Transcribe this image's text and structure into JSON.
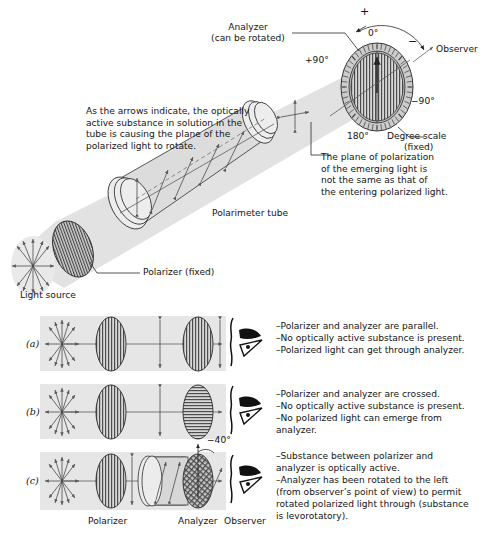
{
  "figure": {
    "top_annotation": "As the arrows indicate, the optically\nactive substance in solution in the\ntube is causing the plane of the\npolarized light to rotate.",
    "right_annotation": "The plane of polarization\nof the emerging light is\nnot the same as that of\nthe entering polarized light."
  },
  "top_labels": {
    "analyzer": "Analyzer",
    "analyzer_sub": "(can be rotated)",
    "observer": "Observer",
    "degree_scale": "Degree scale",
    "degree_scale_sub": "(fixed)",
    "polarimeter_tube": "Polarimeter tube",
    "polarizer_fixed": "Polarizer (fixed)",
    "light_source": "Light source",
    "plus_sign": "+",
    "minus_sign": "−"
  },
  "dial": {
    "zero": "0°",
    "plus90": "+90°",
    "minus90": "−90°",
    "one_eighty": "180°",
    "tick_count": 48
  },
  "rows": [
    {
      "id": "a",
      "label": "(a)",
      "analyzer_orientation": "vertical",
      "notes": [
        "–Polarizer and analyzer are parallel.",
        "–No optically active substance is present.",
        "–Polarized light can get through analyzer."
      ]
    },
    {
      "id": "b",
      "label": "(b)",
      "analyzer_orientation": "horizontal",
      "notes": [
        "–Polarizer and analyzer are crossed.",
        "–No optically active substance is present.",
        "–No polarized light can emerge from",
        "  analyzer."
      ]
    },
    {
      "id": "c",
      "label": "(c)",
      "analyzer_orientation": "rotated",
      "rotation_label": "−40°",
      "notes": [
        "–Substance between polarizer and",
        "  analyzer is optically active.",
        "–Analyzer has been rotated to the left",
        "  (from observer’s point of view) to permit",
        "  rotated polarized light through (substance",
        "  is levorotatory)."
      ]
    }
  ],
  "bottom_labels": {
    "polarizer": "Polarizer",
    "analyzer": "Analyzer",
    "observer": "Observer"
  },
  "colors": {
    "beam": "#e2e2e2",
    "tube": "#dcdcdc",
    "ink": "#141414",
    "stripe": "#555555"
  }
}
